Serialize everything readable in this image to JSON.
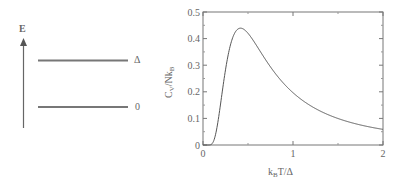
{
  "energy_diagram": {
    "axis_label": "E",
    "levels": [
      {
        "name": "upper",
        "label": "Δ"
      },
      {
        "name": "ground",
        "label": "0"
      }
    ]
  },
  "chart_data": {
    "type": "line",
    "title": "",
    "xlabel": "k_B T/Δ",
    "ylabel": "C_V/Nk_B",
    "xlim": [
      0,
      2
    ],
    "ylim": [
      0,
      0.5
    ],
    "x_ticks": [
      0,
      1,
      2
    ],
    "x_minor_ticks": [
      0.5,
      1.5
    ],
    "y_ticks": [
      0,
      0.1,
      0.2,
      0.3,
      0.4,
      0.5
    ],
    "y_tick_labels": [
      "0",
      "0.1",
      "0.2",
      "0.3",
      "0.4",
      "0.5"
    ],
    "x_tick_labels": [
      "0",
      "1",
      "2"
    ],
    "grid": false,
    "legend": null,
    "series": [
      {
        "name": "Schottky heat capacity (two-level system)",
        "x": [
          0.05,
          0.1,
          0.15,
          0.2,
          0.25,
          0.3,
          0.35,
          0.4,
          0.42,
          0.45,
          0.5,
          0.6,
          0.7,
          0.8,
          0.9,
          1.0,
          1.2,
          1.4,
          1.6,
          1.8,
          2.0
        ],
        "y": [
          0.0,
          0.005,
          0.056,
          0.166,
          0.281,
          0.365,
          0.415,
          0.438,
          0.439,
          0.437,
          0.42,
          0.37,
          0.318,
          0.274,
          0.237,
          0.197,
          0.147,
          0.112,
          0.088,
          0.071,
          0.059
        ]
      }
    ],
    "annotations": [
      {
        "text": "peak ≈ 0.44 at k_B T/Δ ≈ 0.42"
      }
    ]
  },
  "text": {
    "y_axis_title_main": "C",
    "y_axis_title_sub1": "V",
    "y_axis_title_mid": "/Nk",
    "y_axis_title_sub2": "B",
    "x_axis_title_main": "k",
    "x_axis_title_sub": "B",
    "x_axis_title_rest": "T/Δ"
  }
}
